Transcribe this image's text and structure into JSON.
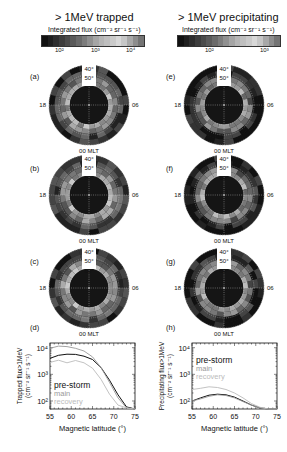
{
  "figure": {
    "left_column": {
      "title": "> 1MeV trapped",
      "colorbar": {
        "label": "Integrated flux (cm⁻² sr⁻¹ s⁻¹)",
        "ticks": [
          "10²",
          "10³",
          "10⁴"
        ],
        "shades": [
          "#111",
          "#1f1f1f",
          "#2e2e2e",
          "#3d3d3d",
          "#4b4b4b",
          "#5a5a5a",
          "#6a6a6a",
          "#7c7c7c",
          "#909090",
          "#a5a5a5",
          "#b5b5b5",
          "#bfbfbf",
          "#cacaca",
          "#d8d8d8",
          "#c6c6c6",
          "#a8a8a8",
          "#8d8d8d",
          "#747474"
        ]
      },
      "panels": [
        {
          "label": "(a)"
        },
        {
          "label": "(b)"
        },
        {
          "label": "(c)"
        }
      ]
    },
    "right_column": {
      "title": "> 1MeV precipitating",
      "colorbar": {
        "label": "Integrated flux (cm⁻² sr⁻¹ s⁻¹)",
        "ticks": [
          "10²",
          "10³"
        ],
        "shades": [
          "#111",
          "#1f1f1f",
          "#2e2e2e",
          "#3d3d3d",
          "#4b4b4b",
          "#5a5a5a",
          "#6a6a6a",
          "#7c7c7c",
          "#909090",
          "#a5a5a5",
          "#b5b5b5",
          "#bfbfbf",
          "#cacaca",
          "#d8d8d8",
          "#c6c6c6",
          "#a8a8a8",
          "#8d8d8d",
          "#747474"
        ]
      },
      "panels": [
        {
          "label": "(e)"
        },
        {
          "label": "(f)"
        },
        {
          "label": "(g)"
        }
      ]
    },
    "polar": {
      "lat_labels": [
        "40°",
        "50°",
        "60°"
      ],
      "left_mlt": "18",
      "right_mlt": "06",
      "bottom_mlt": "00 MLT"
    }
  },
  "chart_data": [
    {
      "panel": "(d)",
      "type": "line",
      "title": "",
      "xlabel": "Magnetic latitude (°)",
      "ylabel": "Trapped flux>1MeV (cm⁻² sr⁻¹ s⁻¹)",
      "yscale": "log",
      "xlim": [
        55,
        75
      ],
      "ylim": [
        50,
        15000
      ],
      "xticks": [
        "55",
        "60",
        "65",
        "70",
        "75"
      ],
      "yticks": [
        "10²",
        "10³",
        "10⁴"
      ],
      "x": [
        55,
        57,
        59,
        61,
        63,
        65,
        67,
        69,
        71,
        73,
        75
      ],
      "series": [
        {
          "name": "pre-storm",
          "color": "#111111",
          "values": [
            4000,
            5200,
            5700,
            5600,
            4800,
            3600,
            1800,
            600,
            170,
            60,
            50
          ]
        },
        {
          "name": "main",
          "color": "#999999",
          "values": [
            9500,
            11500,
            11000,
            9500,
            7500,
            4500,
            1800,
            500,
            130,
            55,
            50
          ]
        },
        {
          "name": "recovery",
          "color": "#bbbbbb",
          "values": [
            2800,
            3400,
            2700,
            3300,
            2700,
            1700,
            650,
            180,
            70,
            55,
            50
          ]
        }
      ],
      "legend": [
        "pre-storm",
        "main",
        "recovery"
      ],
      "legend_position": "lower-left"
    },
    {
      "panel": "(h)",
      "type": "line",
      "title": "",
      "xlabel": "Magnetic latitude (°)",
      "ylabel": "Precipitating flux>1MeV (cm⁻² sr⁻¹ s⁻¹)",
      "yscale": "log",
      "xlim": [
        55,
        75
      ],
      "ylim": [
        50,
        15000
      ],
      "xticks": [
        "55",
        "60",
        "65",
        "70",
        "75"
      ],
      "yticks": [
        "10²",
        "10³",
        "10⁴"
      ],
      "x": [
        55,
        57,
        59,
        61,
        63,
        65,
        67,
        69,
        71,
        73,
        75
      ],
      "series": [
        {
          "name": "pre-storm",
          "color": "#111111",
          "values": [
            100,
            130,
            165,
            180,
            170,
            140,
            100,
            70,
            55,
            50,
            50
          ]
        },
        {
          "name": "main",
          "color": "#999999",
          "values": [
            100,
            120,
            150,
            170,
            160,
            130,
            95,
            70,
            55,
            50,
            50
          ]
        },
        {
          "name": "recovery",
          "color": "#bbbbbb",
          "values": [
            270,
            300,
            340,
            320,
            270,
            200,
            130,
            80,
            58,
            50,
            50
          ]
        }
      ],
      "legend": [
        "pre-storm",
        "main",
        "recovery"
      ],
      "legend_position": "upper-left"
    }
  ],
  "line_panels": {
    "d": {
      "label": "(d)"
    },
    "h": {
      "label": "(h)"
    }
  }
}
